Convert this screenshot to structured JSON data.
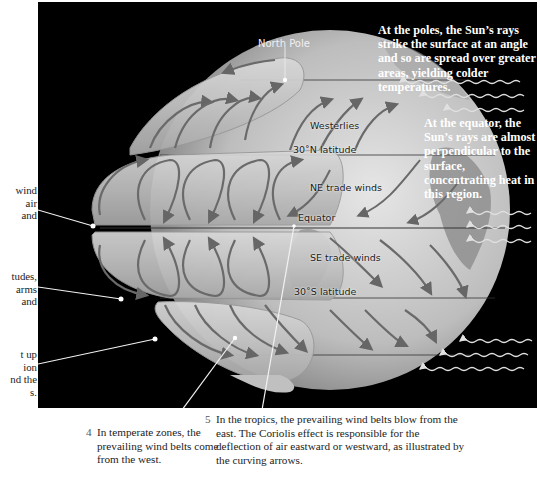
{
  "diagram": {
    "globe_labels": {
      "north_pole": "North Pole",
      "westerlies": "Westerlies",
      "lat_30n": "30˚N latitude",
      "ne_trade_winds": "NE trade winds",
      "equator": "Equator",
      "se_trade_winds": "SE trade winds",
      "lat_30s": "30˚S latitude"
    },
    "callouts": {
      "poles": "At the poles, the Sun’s rays strike the surface at an angle and so are spread over greater areas, yielding colder temperatures.",
      "equator": "At the equator, the Sun’s rays are almost perpendicular to the surface, concentrating heat in this region."
    },
    "left_fragments": {
      "item1": [
        "wind",
        "air",
        "and"
      ],
      "item2": [
        "tudes,",
        "arms",
        "and"
      ],
      "item3": [
        "t up",
        "ion",
        "nd the",
        "s."
      ]
    },
    "captions": [
      {
        "number": "4",
        "text": "In temperate zones, the prevailing wind belts come from the west."
      },
      {
        "number": "5",
        "text": "In the tropics, the prevailing wind belts blow from the east. The Coriolis effect is responsible for the deflection of air eastward or westward, as illustrated by the curving arrows."
      }
    ],
    "colors": {
      "background": "#000000",
      "globe": "#c8c8c8",
      "arrows": "#6a6a6a",
      "callout_text": "#ffffff"
    }
  }
}
